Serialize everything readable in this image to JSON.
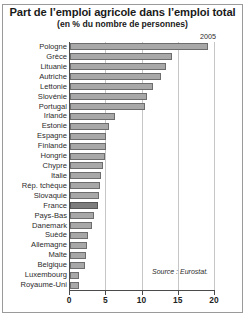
{
  "chart_data": {
    "type": "bar",
    "orientation": "horizontal",
    "title": "Part de l’emploi agricole dans l’emploi total",
    "subtitle": "(en % du nombre de personnes)",
    "series_label": "2005",
    "source": "Source : Eurostat.",
    "xlabel": "",
    "ylabel": "",
    "xlim": [
      0,
      20
    ],
    "xticks": [
      0,
      5,
      10,
      15,
      20
    ],
    "xtick_labels": [
      "0",
      "5",
      "10",
      "15",
      "20"
    ],
    "grid": true,
    "legend": "none",
    "highlight_category": "France",
    "categories": [
      "Pologne",
      "Grèce",
      "Lituanie",
      "Autriche",
      "Lettonie",
      "Slovénie",
      "Portugal",
      "Irlande",
      "Estonie",
      "Espagne",
      "Finlande",
      "Hongrie",
      "Chypre",
      "Italie",
      "Rép. tchèque",
      "Slovaquie",
      "France",
      "Pays-Bas",
      "Danemark",
      "Suède",
      "Allemagne",
      "Malte",
      "Belgique",
      "Luxembourg",
      "Royaume-Uni"
    ],
    "values": [
      19.0,
      14.0,
      13.3,
      12.5,
      11.4,
      10.6,
      10.3,
      6.2,
      5.4,
      5.0,
      4.9,
      4.8,
      4.6,
      4.3,
      4.1,
      4.0,
      3.8,
      3.3,
      3.1,
      2.5,
      2.3,
      2.2,
      2.0,
      1.3,
      1.2
    ]
  }
}
